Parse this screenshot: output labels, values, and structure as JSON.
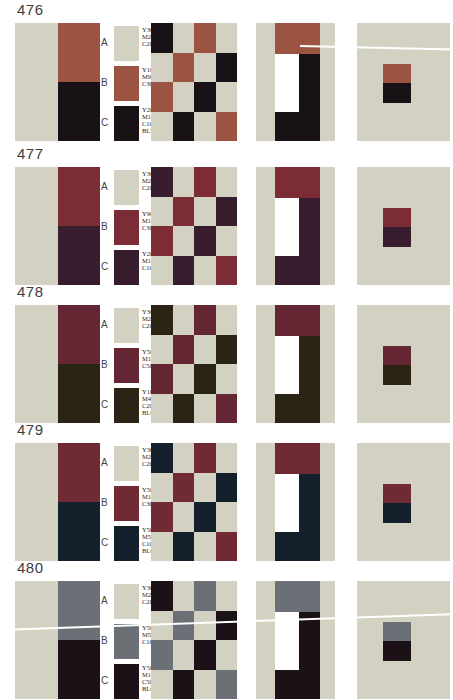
{
  "page": {
    "background": "#ffffff"
  },
  "shared": {
    "paper_white": "#ffffff"
  },
  "checker_pattern": [
    "CABA",
    "ABAC",
    "BACA",
    "ACAB"
  ],
  "rows": [
    {
      "number": "476",
      "swatches": {
        "A": {
          "letter": "A",
          "color": "#d2d1c2",
          "lines": [
            "Y30",
            "M20",
            "C20"
          ]
        },
        "B": {
          "letter": "B",
          "color": "#9b5342",
          "lines": [
            "Y100",
            "M90",
            "C30"
          ]
        },
        "C": {
          "letter": "C",
          "color": "#181115",
          "lines": [
            "Y20",
            "M100",
            "C100",
            "BL50"
          ]
        }
      }
    },
    {
      "number": "477",
      "swatches": {
        "A": {
          "letter": "A",
          "color": "#d2d1c2",
          "lines": [
            "Y30",
            "M20",
            "C20"
          ]
        },
        "B": {
          "letter": "B",
          "color": "#7c2c35",
          "lines": [
            "Y90",
            "M100",
            "C30"
          ]
        },
        "C": {
          "letter": "C",
          "color": "#381d2e",
          "lines": [
            "Y20",
            "M100",
            "C100"
          ]
        }
      }
    },
    {
      "number": "478",
      "swatches": {
        "A": {
          "letter": "A",
          "color": "#d2d1c2",
          "lines": [
            "Y30",
            "M20",
            "C20"
          ]
        },
        "B": {
          "letter": "B",
          "color": "#642632",
          "lines": [
            "Y50",
            "M100",
            "C50"
          ]
        },
        "C": {
          "letter": "C",
          "color": "#2b2415",
          "lines": [
            "Y100",
            "M40",
            "C20",
            "BL60"
          ]
        }
      }
    },
    {
      "number": "479",
      "swatches": {
        "A": {
          "letter": "A",
          "color": "#d2d1c2",
          "lines": [
            "Y30",
            "M20",
            "C20"
          ]
        },
        "B": {
          "letter": "B",
          "color": "#702a34",
          "lines": [
            "Y50",
            "M100",
            "C30"
          ]
        },
        "C": {
          "letter": "C",
          "color": "#14202b",
          "lines": [
            "Y50",
            "M50",
            "C100",
            "BL60"
          ]
        }
      }
    },
    {
      "number": "480",
      "swatches": {
        "A": {
          "letter": "A",
          "color": "#d2d1c2",
          "lines": [
            "Y30",
            "M20",
            "C20"
          ]
        },
        "B": {
          "letter": "B",
          "color": "#6b7077",
          "lines": [
            "Y50",
            "M50",
            "C100"
          ]
        },
        "C": {
          "letter": "C",
          "color": "#1b1116",
          "lines": [
            "Y50",
            "M100",
            "C50",
            "BL60"
          ]
        }
      }
    }
  ]
}
